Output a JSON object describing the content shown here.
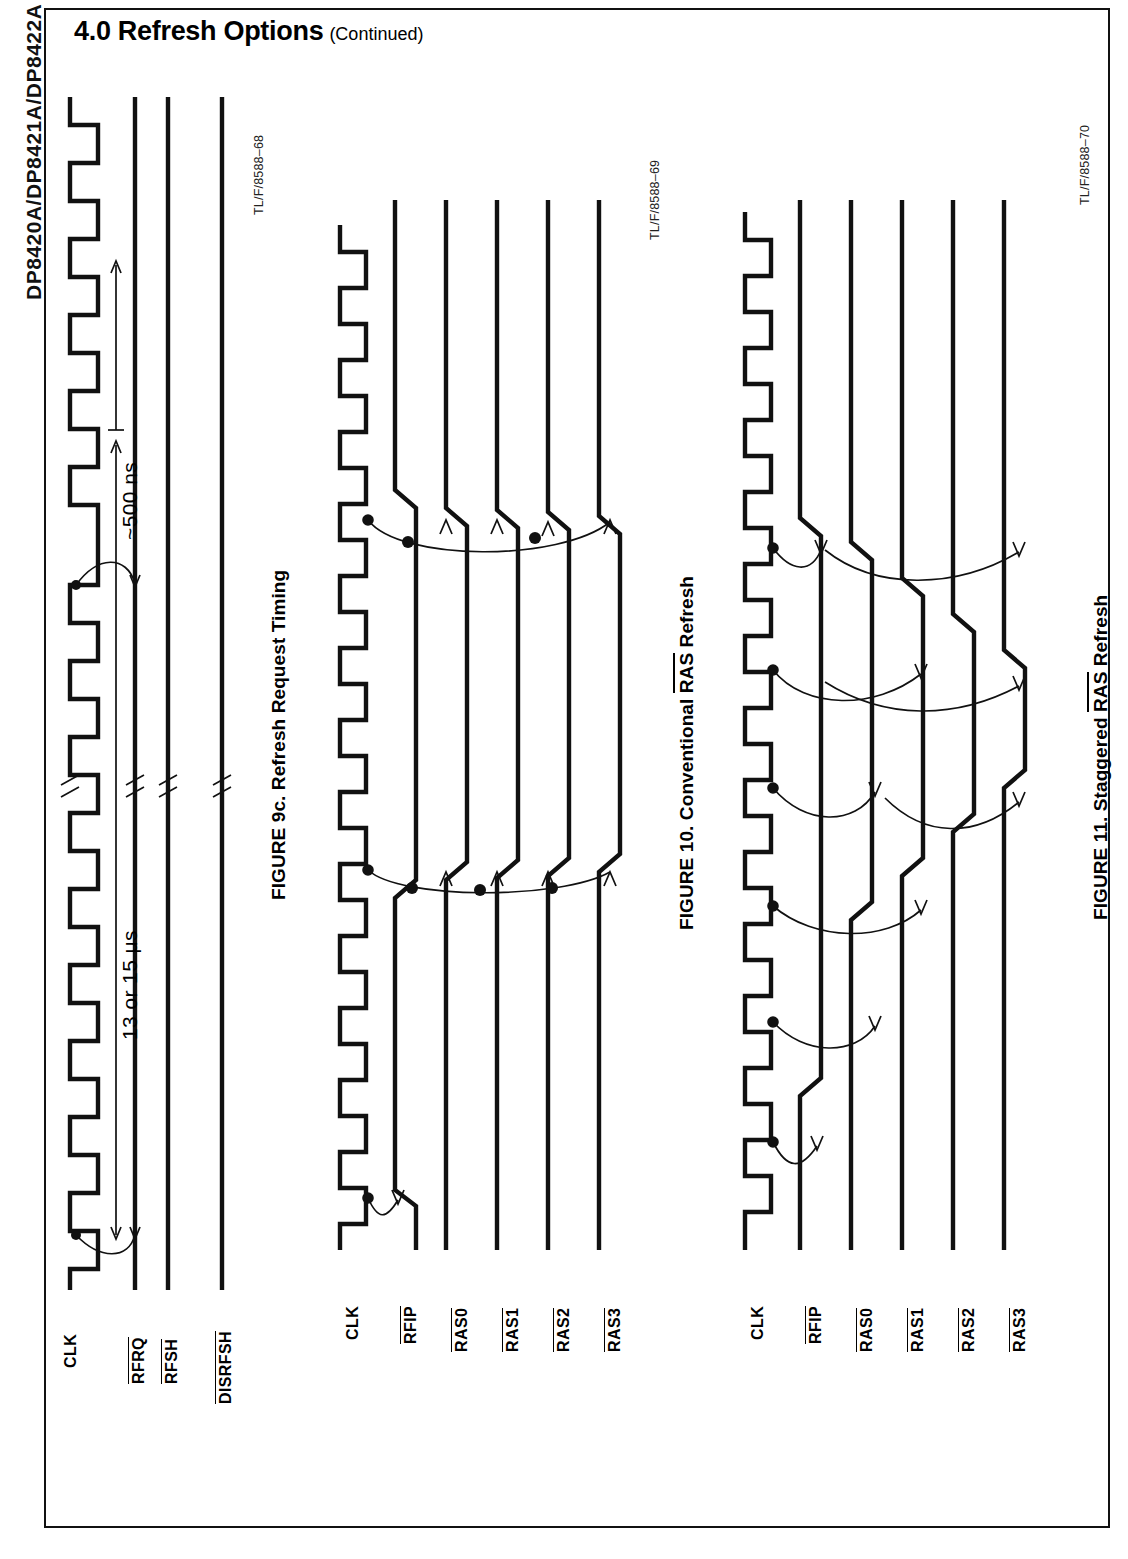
{
  "document": {
    "spine_label": "DP8420A/DP8421A/DP8422A",
    "section_title": "4.0 Refresh Options",
    "section_continued": "(Continued)"
  },
  "figures": [
    {
      "id": "figure-9c",
      "caption_pre": "FIGURE 9c. Refresh Request Timing",
      "caption_plain": "FIGURE 9c. Refresh Request Timing",
      "source_id": "TL/F/8588–68",
      "signals": [
        {
          "name": "CLK",
          "overline": false
        },
        {
          "name": "RFRQ",
          "overline": true
        },
        {
          "name": "RFSH",
          "overline": true
        },
        {
          "name": "DISRFSH",
          "overline": true
        }
      ],
      "annotations": [
        {
          "name": "refresh-period",
          "text": "13 or 15 μs"
        },
        {
          "name": "pulse-width",
          "text": "~500 ns"
        }
      ]
    },
    {
      "id": "figure-10",
      "caption_lead": "FIGURE 10. Conventional ",
      "caption_overlined": "RAS",
      "caption_tail": " Refresh",
      "caption_plain": "FIGURE 10. Conventional RAS Refresh",
      "source_id": "TL/F/8588–69",
      "signals": [
        {
          "name": "CLK",
          "overline": false
        },
        {
          "name": "RFIP",
          "overline": true
        },
        {
          "name": "RAS0",
          "overline": true
        },
        {
          "name": "RAS1",
          "overline": true
        },
        {
          "name": "RAS2",
          "overline": true
        },
        {
          "name": "RAS3",
          "overline": true
        }
      ]
    },
    {
      "id": "figure-11",
      "caption_lead": "FIGURE 11. Staggered ",
      "caption_overlined": "RAS",
      "caption_tail": " Refresh",
      "caption_plain": "FIGURE 11. Staggered RAS Refresh",
      "source_id": "TL/F/8588–70",
      "signals": [
        {
          "name": "CLK",
          "overline": false
        },
        {
          "name": "RFIP",
          "overline": true
        },
        {
          "name": "RAS0",
          "overline": true
        },
        {
          "name": "RAS1",
          "overline": true
        },
        {
          "name": "RAS2",
          "overline": true
        },
        {
          "name": "RAS3",
          "overline": true
        }
      ]
    }
  ],
  "colors": {
    "ink": "#111111",
    "paper": "#ffffff"
  }
}
